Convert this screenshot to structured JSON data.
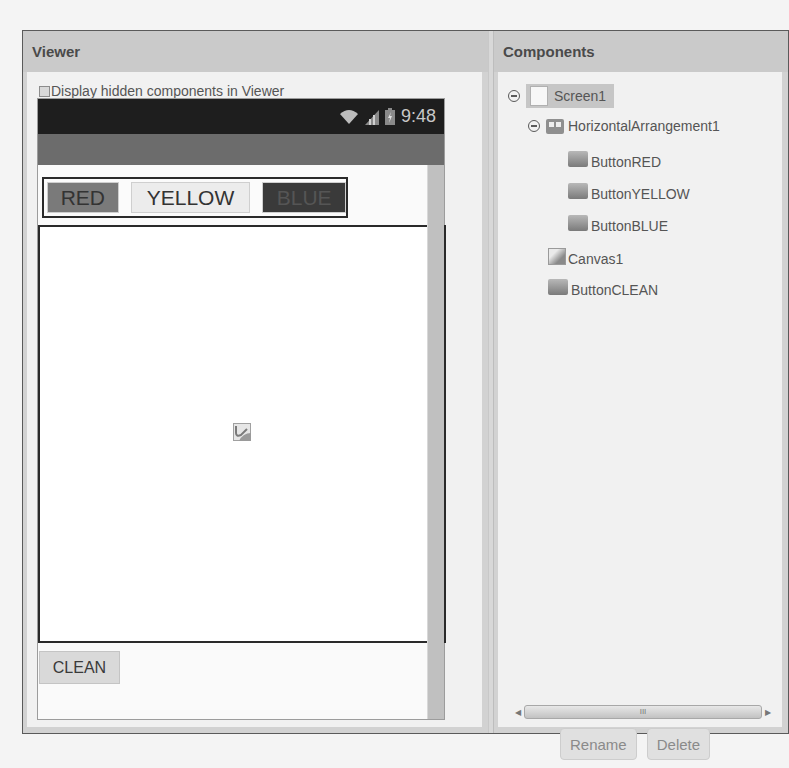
{
  "viewer": {
    "title": "Viewer",
    "hidden_toggle_label": "Display hidden components in Viewer",
    "hidden_toggle_checked": false,
    "phone": {
      "time": "9:48",
      "status_icons": [
        "wifi-icon",
        "signal-icon",
        "battery-charging-icon"
      ],
      "buttons": [
        {
          "label": "RED",
          "color": "#7a7a7a"
        },
        {
          "label": "YELLOW",
          "color": "#ececec"
        },
        {
          "label": "BLUE",
          "color": "#3a3a3a"
        }
      ],
      "canvas_icon": "canvas-icon",
      "clean_button": "CLEAN"
    }
  },
  "components": {
    "title": "Components",
    "tree": [
      {
        "name": "Screen1",
        "icon": "screen-icon",
        "level": 0,
        "expanded": true,
        "selected": true
      },
      {
        "name": "HorizontalArrangement1",
        "icon": "horizontal-arrangement-icon",
        "level": 1,
        "expanded": true
      },
      {
        "name": "ButtonRED",
        "icon": "button-icon",
        "level": 2
      },
      {
        "name": "ButtonYELLOW",
        "icon": "button-icon",
        "level": 2
      },
      {
        "name": "ButtonBLUE",
        "icon": "button-icon",
        "level": 2
      },
      {
        "name": "Canvas1",
        "icon": "canvas-icon",
        "level": 1
      },
      {
        "name": "ButtonCLEAN",
        "icon": "button-icon",
        "level": 1
      }
    ],
    "scroll_grip": "III",
    "rename_label": "Rename",
    "delete_label": "Delete"
  }
}
